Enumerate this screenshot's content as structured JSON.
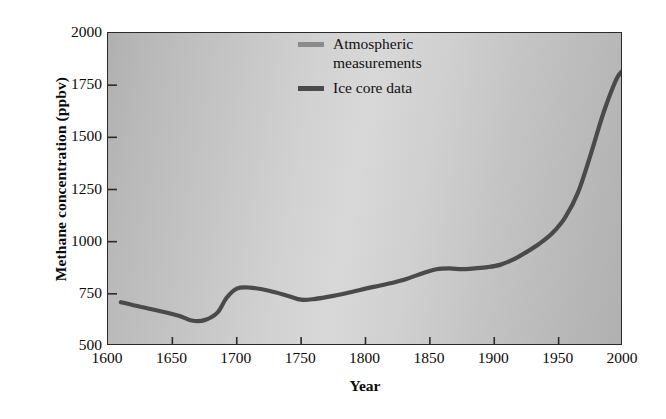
{
  "chart_data": {
    "type": "line",
    "title": "",
    "xlabel": "Year",
    "ylabel": "Methane concentration (ppbv)",
    "xlim": [
      1600,
      2000
    ],
    "ylim": [
      500,
      2000
    ],
    "grid": false,
    "legend_position": "upper-center",
    "xticks": [
      1600,
      1650,
      1700,
      1750,
      1800,
      1850,
      1900,
      1950,
      2000
    ],
    "yticks": [
      500,
      750,
      1000,
      1250,
      1500,
      1750,
      2000
    ],
    "xtick_labels": [
      "1600",
      "1650",
      "1700",
      "1750",
      "1800",
      "1850",
      "1900",
      "1950",
      "2000"
    ],
    "ytick_labels": [
      "500",
      "750",
      "1000",
      "1250",
      "1500",
      "1750",
      "2000"
    ],
    "series": [
      {
        "name": "Atmospheric measurements",
        "color": "#8b8b8b",
        "x": [],
        "values": []
      },
      {
        "name": "Ice core data",
        "color": "#4a4a4a",
        "x": [
          1610,
          1625,
          1640,
          1655,
          1665,
          1675,
          1685,
          1692,
          1700,
          1710,
          1725,
          1740,
          1750,
          1760,
          1775,
          1790,
          1800,
          1815,
          1830,
          1845,
          1855,
          1865,
          1875,
          1885,
          1895,
          1905,
          1915,
          1925,
          1935,
          1945,
          1955,
          1965,
          1975,
          1985,
          1995,
          2000
        ],
        "values": [
          710,
          688,
          668,
          645,
          622,
          624,
          660,
          730,
          775,
          780,
          765,
          740,
          722,
          725,
          740,
          760,
          775,
          795,
          818,
          850,
          868,
          872,
          868,
          872,
          878,
          890,
          915,
          950,
          990,
          1040,
          1115,
          1235,
          1420,
          1620,
          1780,
          1820
        ]
      }
    ]
  },
  "legend": {
    "entries": [
      {
        "label_line1": "Atmospheric",
        "label_line2": "measurements",
        "color": "#8b8b8b"
      },
      {
        "label_line1": "Ice core data",
        "label_line2": "",
        "color": "#4a4a4a"
      }
    ]
  },
  "colors": {
    "ice_core_line": "#4a4a4a",
    "atmospheric_line": "#8b8b8b",
    "frame": "#2a2a2a",
    "text": "#0b0b0b",
    "plot_bg_edge": "#b0b0b0",
    "plot_bg_center": "#d8d8d8"
  }
}
